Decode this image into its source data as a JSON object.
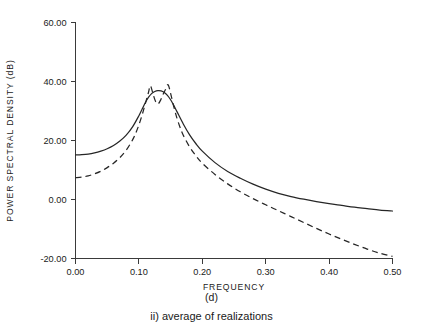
{
  "figure": {
    "background_color": "#ffffff",
    "line_color": "#262626",
    "axis_color": "#3a3a3a",
    "panel_label": "(d)",
    "subcaption": "ii) average of realizations"
  },
  "chart_data": {
    "type": "line",
    "title": "",
    "xlabel": "FREQUENCY",
    "ylabel": "POWER SPECTRAL DENSITY (dB)",
    "xlim": [
      0.0,
      0.5
    ],
    "ylim": [
      -20.0,
      60.0
    ],
    "xticks": [
      0.0,
      0.1,
      0.2,
      0.3,
      0.4,
      0.5
    ],
    "xtick_labels": [
      "0.00",
      "0.10",
      "0.20",
      "0.30",
      "0.40",
      "0.50"
    ],
    "yticks": [
      -20.0,
      0.0,
      20.0,
      40.0,
      60.0
    ],
    "ytick_labels": [
      "-20.00",
      "0.00",
      "20.00",
      "40.00",
      "60.00"
    ],
    "grid": false,
    "legend": "none",
    "series": [
      {
        "name": "true spectrum",
        "style": "solid",
        "x": [
          0.0,
          0.01,
          0.02,
          0.03,
          0.04,
          0.05,
          0.06,
          0.07,
          0.08,
          0.09,
          0.1,
          0.105,
          0.11,
          0.115,
          0.12,
          0.125,
          0.13,
          0.135,
          0.14,
          0.145,
          0.15,
          0.155,
          0.16,
          0.17,
          0.18,
          0.19,
          0.2,
          0.22,
          0.24,
          0.26,
          0.28,
          0.3,
          0.32,
          0.34,
          0.36,
          0.38,
          0.4,
          0.42,
          0.44,
          0.46,
          0.48,
          0.5
        ],
        "y": [
          15.1,
          15.2,
          15.4,
          15.8,
          16.4,
          17.2,
          18.3,
          19.8,
          21.8,
          24.6,
          28.4,
          30.6,
          32.8,
          34.6,
          35.9,
          36.6,
          36.9,
          36.8,
          36.3,
          35.3,
          33.8,
          31.9,
          29.8,
          25.6,
          21.9,
          18.9,
          16.4,
          12.5,
          9.5,
          7.2,
          5.2,
          3.5,
          2.1,
          1.0,
          0.1,
          -0.7,
          -1.4,
          -2.0,
          -2.6,
          -3.1,
          -3.6,
          -3.9
        ]
      },
      {
        "name": "averaged periodogram estimate",
        "style": "dashed",
        "x": [
          0.0,
          0.01,
          0.02,
          0.03,
          0.04,
          0.05,
          0.06,
          0.07,
          0.08,
          0.09,
          0.095,
          0.1,
          0.105,
          0.11,
          0.115,
          0.118,
          0.122,
          0.126,
          0.13,
          0.134,
          0.138,
          0.142,
          0.146,
          0.15,
          0.155,
          0.16,
          0.165,
          0.17,
          0.18,
          0.19,
          0.2,
          0.22,
          0.24,
          0.26,
          0.28,
          0.3,
          0.32,
          0.34,
          0.36,
          0.38,
          0.4,
          0.42,
          0.44,
          0.46,
          0.48,
          0.5
        ],
        "y": [
          7.4,
          7.6,
          8.0,
          8.7,
          9.6,
          10.8,
          12.3,
          14.2,
          16.7,
          20.2,
          22.5,
          25.3,
          28.6,
          32.4,
          36.2,
          38.6,
          36.0,
          33.4,
          32.4,
          33.6,
          35.6,
          37.3,
          38.9,
          36.0,
          31.5,
          27.6,
          24.4,
          21.8,
          17.8,
          14.8,
          12.3,
          8.5,
          5.3,
          2.6,
          0.3,
          -1.8,
          -3.8,
          -5.8,
          -7.8,
          -9.8,
          -11.7,
          -13.5,
          -15.2,
          -16.8,
          -18.2,
          -19.3
        ]
      }
    ]
  }
}
